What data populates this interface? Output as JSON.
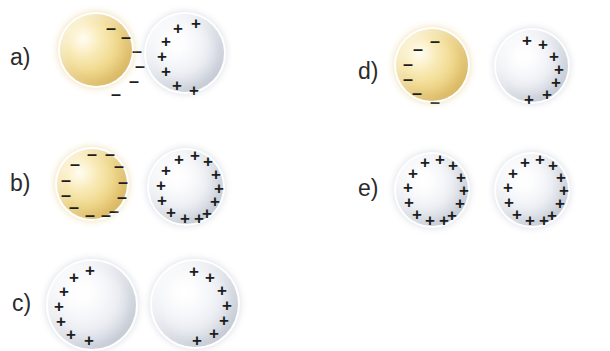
{
  "figure": {
    "background_color": "#ffffff",
    "width": 610,
    "height": 346,
    "colors": {
      "gold_sphere": "#f2dc94",
      "gold_sphere_edge": "#cfa94f",
      "gray_sphere": "#e0e3ea",
      "gray_sphere_edge": "#b9bfcb",
      "charge_symbol": "#1d1d1d",
      "label_text": "#2b2b2b"
    },
    "charge_symbols": {
      "negative": "–",
      "positive": "+"
    }
  },
  "options": [
    {
      "id": "a",
      "label": "a)",
      "label_x": 10,
      "label_y": 46,
      "spheres": [
        {
          "name": "gold-sphere",
          "material": "gold",
          "x": 60,
          "y": 14,
          "size": 72,
          "charge_sign": "negative",
          "charge_count": 6,
          "charge_arc": "right",
          "charges": [
            {
              "cx": 51,
              "cy": 14
            },
            {
              "cx": 66,
              "cy": 23
            },
            {
              "cx": 77,
              "cy": 37
            },
            {
              "cx": 80,
              "cy": 52
            },
            {
              "cx": 74,
              "cy": 67
            },
            {
              "cx": 56,
              "cy": 80
            }
          ]
        },
        {
          "name": "gray-sphere",
          "material": "gray",
          "x": 146,
          "y": 14,
          "size": 78,
          "charge_sign": "positive",
          "charge_count": 7,
          "charge_arc": "left",
          "charges": [
            {
              "cx": 50,
              "cy": 9
            },
            {
              "cx": 32,
              "cy": 14
            },
            {
              "cx": 20,
              "cy": 27
            },
            {
              "cx": 16,
              "cy": 42
            },
            {
              "cx": 20,
              "cy": 57
            },
            {
              "cx": 31,
              "cy": 71
            },
            {
              "cx": 48,
              "cy": 76
            }
          ]
        }
      ]
    },
    {
      "id": "b",
      "label": "b)",
      "label_x": 10,
      "label_y": 172,
      "spheres": [
        {
          "name": "gold-sphere",
          "material": "gold",
          "x": 57,
          "y": 149,
          "size": 70,
          "charge_sign": "negative",
          "charge_count": 12,
          "charge_arc": "full",
          "charges": [
            {
              "cx": 35,
              "cy": 5
            },
            {
              "cx": 53,
              "cy": 5
            },
            {
              "cx": 18,
              "cy": 15
            },
            {
              "cx": 62,
              "cy": 17
            },
            {
              "cx": 9,
              "cy": 31
            },
            {
              "cx": 66,
              "cy": 33
            },
            {
              "cx": 9,
              "cy": 46
            },
            {
              "cx": 65,
              "cy": 48
            },
            {
              "cx": 17,
              "cy": 58
            },
            {
              "cx": 57,
              "cy": 62
            },
            {
              "cx": 33,
              "cy": 66
            },
            {
              "cx": 49,
              "cy": 66
            }
          ]
        },
        {
          "name": "gray-sphere",
          "material": "gray",
          "x": 149,
          "y": 150,
          "size": 74,
          "charge_sign": "positive",
          "charge_count": 13,
          "charge_arc": "full",
          "charges": [
            {
              "cx": 30,
              "cy": 9
            },
            {
              "cx": 46,
              "cy": 5
            },
            {
              "cx": 59,
              "cy": 11
            },
            {
              "cx": 17,
              "cy": 20
            },
            {
              "cx": 67,
              "cy": 24
            },
            {
              "cx": 12,
              "cy": 35
            },
            {
              "cx": 70,
              "cy": 38
            },
            {
              "cx": 13,
              "cy": 50
            },
            {
              "cx": 66,
              "cy": 51
            },
            {
              "cx": 22,
              "cy": 62
            },
            {
              "cx": 58,
              "cy": 63
            },
            {
              "cx": 36,
              "cy": 68
            },
            {
              "cx": 50,
              "cy": 68
            }
          ]
        }
      ]
    },
    {
      "id": "c",
      "label": "c)",
      "label_x": 12,
      "label_y": 292,
      "spheres": [
        {
          "name": "gray-sphere-left",
          "material": "gray",
          "x": 48,
          "y": 261,
          "size": 88,
          "charge_sign": "positive",
          "charge_count": 7,
          "charge_arc": "left",
          "charges": [
            {
              "cx": 42,
              "cy": 9
            },
            {
              "cx": 26,
              "cy": 16
            },
            {
              "cx": 16,
              "cy": 30
            },
            {
              "cx": 11,
              "cy": 45
            },
            {
              "cx": 13,
              "cy": 60
            },
            {
              "cx": 23,
              "cy": 73
            },
            {
              "cx": 41,
              "cy": 79
            }
          ]
        },
        {
          "name": "gray-sphere-right",
          "material": "gray",
          "x": 152,
          "y": 261,
          "size": 86,
          "charge_sign": "positive",
          "charge_count": 7,
          "charge_arc": "right",
          "charges": [
            {
              "cx": 42,
              "cy": 10
            },
            {
              "cx": 58,
              "cy": 16
            },
            {
              "cx": 70,
              "cy": 29
            },
            {
              "cx": 75,
              "cy": 44
            },
            {
              "cx": 72,
              "cy": 59
            },
            {
              "cx": 62,
              "cy": 72
            },
            {
              "cx": 45,
              "cy": 79
            }
          ]
        }
      ]
    },
    {
      "id": "d",
      "label": "d)",
      "label_x": 358,
      "label_y": 60,
      "spheres": [
        {
          "name": "gold-sphere",
          "material": "gold",
          "x": 396,
          "y": 29,
          "size": 72,
          "charge_sign": "negative",
          "charge_count": 6,
          "charge_arc": "left",
          "charges": [
            {
              "cx": 39,
              "cy": 12
            },
            {
              "cx": 22,
              "cy": 20
            },
            {
              "cx": 12,
              "cy": 35
            },
            {
              "cx": 12,
              "cy": 50
            },
            {
              "cx": 21,
              "cy": 64
            },
            {
              "cx": 39,
              "cy": 73
            }
          ]
        },
        {
          "name": "gray-sphere",
          "material": "gray",
          "x": 496,
          "y": 30,
          "size": 72,
          "charge_sign": "positive",
          "charge_count": 7,
          "charge_arc": "right",
          "charges": [
            {
              "cx": 31,
              "cy": 10
            },
            {
              "cx": 47,
              "cy": 14
            },
            {
              "cx": 58,
              "cy": 26
            },
            {
              "cx": 63,
              "cy": 39
            },
            {
              "cx": 60,
              "cy": 52
            },
            {
              "cx": 51,
              "cy": 64
            },
            {
              "cx": 33,
              "cy": 69
            }
          ]
        }
      ]
    },
    {
      "id": "e",
      "label": "e)",
      "label_x": 358,
      "label_y": 177,
      "spheres": [
        {
          "name": "gray-sphere-left",
          "material": "gray",
          "x": 396,
          "y": 154,
          "size": 72,
          "charge_sign": "positive",
          "charge_count": 13,
          "charge_arc": "full",
          "charges": [
            {
              "cx": 29,
              "cy": 8
            },
            {
              "cx": 44,
              "cy": 5
            },
            {
              "cx": 57,
              "cy": 11
            },
            {
              "cx": 17,
              "cy": 19
            },
            {
              "cx": 65,
              "cy": 23
            },
            {
              "cx": 12,
              "cy": 33
            },
            {
              "cx": 68,
              "cy": 36
            },
            {
              "cx": 13,
              "cy": 48
            },
            {
              "cx": 64,
              "cy": 49
            },
            {
              "cx": 21,
              "cy": 60
            },
            {
              "cx": 56,
              "cy": 61
            },
            {
              "cx": 34,
              "cy": 66
            },
            {
              "cx": 48,
              "cy": 66
            }
          ]
        },
        {
          "name": "gray-sphere-right",
          "material": "gray",
          "x": 496,
          "y": 154,
          "size": 72,
          "charge_sign": "positive",
          "charge_count": 13,
          "charge_arc": "full",
          "charges": [
            {
              "cx": 29,
              "cy": 8
            },
            {
              "cx": 44,
              "cy": 5
            },
            {
              "cx": 57,
              "cy": 11
            },
            {
              "cx": 17,
              "cy": 19
            },
            {
              "cx": 65,
              "cy": 23
            },
            {
              "cx": 12,
              "cy": 33
            },
            {
              "cx": 68,
              "cy": 36
            },
            {
              "cx": 13,
              "cy": 48
            },
            {
              "cx": 64,
              "cy": 49
            },
            {
              "cx": 21,
              "cy": 60
            },
            {
              "cx": 56,
              "cy": 61
            },
            {
              "cx": 34,
              "cy": 66
            },
            {
              "cx": 48,
              "cy": 66
            }
          ]
        }
      ]
    }
  ]
}
